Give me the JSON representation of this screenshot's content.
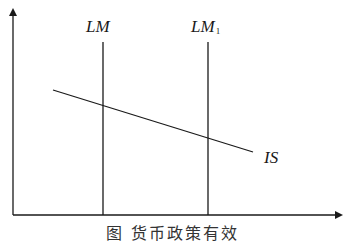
{
  "diagram": {
    "type": "IS-LM",
    "axes": {
      "x_axis": {
        "label": ""
      },
      "y_axis": {
        "label": ""
      }
    },
    "curves": [
      {
        "name": "LM",
        "label": "LM",
        "subscript": "",
        "orientation": "vertical"
      },
      {
        "name": "LM1",
        "label": "LM",
        "subscript": "1",
        "orientation": "vertical"
      },
      {
        "name": "IS",
        "label": "IS",
        "subscript": "",
        "orientation": "downward-sloping"
      }
    ],
    "caption": "图        货币政策有效"
  },
  "colors": {
    "line": "#1a1a1a",
    "background": "#ffffff"
  }
}
